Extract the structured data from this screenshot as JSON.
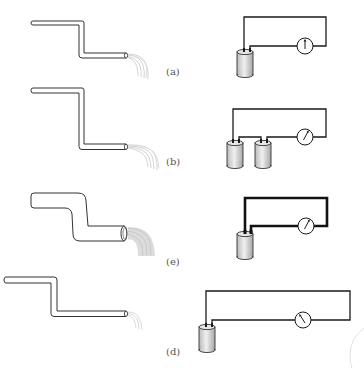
{
  "figure": {
    "colors": {
      "background": "#ffffff",
      "pipe_outline": "#333333",
      "pipe_fill": "#ffffff",
      "spray": "#bdbdbd",
      "wire": "#1a1a1a",
      "battery_fill": "#d9d9d9",
      "battery_outline": "#333333",
      "meter_fill": "#ffffff",
      "label": "#555555"
    },
    "panels": [
      {
        "id": "a",
        "label": "(a)",
        "label_pos": [
          166,
          67
        ],
        "pipe": {
          "thickness": "thin",
          "spray": "small"
        },
        "circuit": {
          "batteries": 1,
          "wire": "thin",
          "meter_needle_deg": 0
        }
      },
      {
        "id": "b",
        "label": "(b)",
        "label_pos": [
          166,
          157
        ],
        "pipe": {
          "thickness": "thin",
          "spray": "long"
        },
        "circuit": {
          "batteries": 2,
          "wire": "thin",
          "meter_needle_deg": 35
        }
      },
      {
        "id": "c",
        "label": "(e)",
        "label_pos": [
          166,
          257
        ],
        "pipe": {
          "thickness": "thick",
          "spray": "large"
        },
        "circuit": {
          "batteries": 1,
          "wire": "thick",
          "meter_needle_deg": 35
        }
      },
      {
        "id": "d",
        "label": "(d)",
        "label_pos": [
          166,
          347
        ],
        "pipe": {
          "thickness": "thin",
          "length": "long",
          "spray": "weak"
        },
        "circuit": {
          "batteries": 1,
          "wire": "thin",
          "length": "long",
          "meter_needle_deg": -35
        }
      }
    ]
  }
}
